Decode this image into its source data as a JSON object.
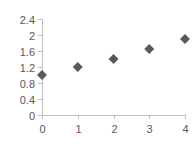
{
  "chart_data": {
    "type": "scatter",
    "title": "",
    "xlabel": "",
    "ylabel": "",
    "x": [
      0,
      1,
      2,
      3,
      4
    ],
    "series": [
      {
        "name": "Series1",
        "values": [
          1.0,
          1.2,
          1.4,
          1.65,
          1.9
        ],
        "marker": "diamond",
        "color": "#595959"
      }
    ],
    "xlim": [
      0,
      4
    ],
    "ylim": [
      0,
      2.4
    ],
    "x_ticks": [
      "0",
      "1",
      "2",
      "3",
      "4"
    ],
    "y_ticks": [
      "0",
      "0.4",
      "0.8",
      "1.2",
      "1.6",
      "2",
      "2.4"
    ],
    "grid": false,
    "legend": "none",
    "axis_color": "#bfbfbf",
    "label_color": "#595959"
  }
}
